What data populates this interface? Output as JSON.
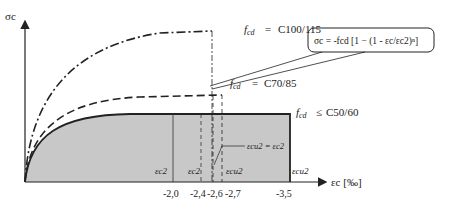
{
  "diagram": {
    "y_axis_label": "σc",
    "x_axis_label": "εc [‰]",
    "curves": [
      {
        "name": "C100/115",
        "label_prefix": "fcd",
        "label_op": "=",
        "label_value": "C100/115",
        "style": "dash-dot"
      },
      {
        "name": "C70/85",
        "label_prefix": "fcd",
        "label_op": "=",
        "label_value": "C70/85",
        "style": "dashed"
      },
      {
        "name": "C50/60",
        "label_prefix": "fcd",
        "label_op": "≤",
        "label_value": "C50/60",
        "style": "solid"
      }
    ],
    "formula": "σc = -fcd [1 − (1 - εc/εc2)ⁿ]",
    "annotation_equal": "εcu2 = εc2",
    "strain_labels": {
      "ec2_1": "εc2",
      "ec2_2": "εc2",
      "ecu2_1": "εcu2",
      "ecu2_2": "εcu2"
    },
    "x_ticks": [
      "-2,0",
      "-2,4",
      "-2,6",
      "-2,7",
      "-3,5"
    ],
    "colors": {
      "shade": "#c8c8c8",
      "line": "#222222"
    }
  }
}
